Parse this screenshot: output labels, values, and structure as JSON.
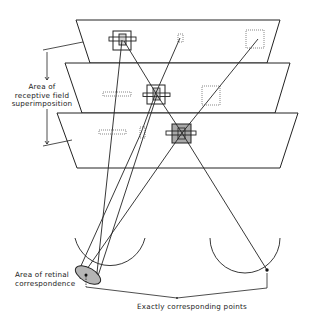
{
  "figure": {
    "labels": {
      "receptive_field": "Area of receptive field superimposition",
      "receptive_field_lines": [
        "Area of",
        "receptive field",
        "superimposition"
      ],
      "retinal_correspondence_lines": [
        "Area of retinal",
        "correspondence"
      ],
      "exactly_corresponding": "Exactly corresponding points"
    },
    "planes": [
      {
        "name": "top-plane",
        "points": "76,20 280,20 267,63 90,63"
      },
      {
        "name": "middle-plane",
        "points": "65,63 290,63 275,113 82,113"
      },
      {
        "name": "bottom-plane",
        "points": "57,113 298,113 280,168 77,168"
      }
    ],
    "colors": {
      "line": "#222222",
      "marker_fill": "#a8a8a8",
      "ellipse_fill": "#b5b5b5"
    }
  }
}
